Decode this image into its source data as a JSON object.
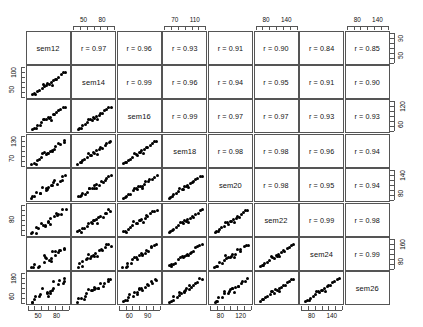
{
  "chart_data": {
    "type": "scatter",
    "subtype": "scatterplot-matrix",
    "title": "",
    "xlabel": "",
    "ylabel": "",
    "grid": false,
    "legend": false,
    "variables": [
      "sem12",
      "sem14",
      "sem16",
      "sem18",
      "sem20",
      "sem22",
      "sem24",
      "sem26"
    ],
    "upper_panel_content": "pearson-correlation",
    "lower_panel_content": "scatter-points",
    "diagonal_content": "variable-name",
    "correlation_prefix": "r = ",
    "correlation_matrix": [
      [
        null,
        "r = 0.97",
        "r = 0.96",
        "r = 0.93",
        "r = 0.91",
        "r = 0.90",
        "r = 0.84",
        "r = 0.85"
      ],
      [
        null,
        null,
        "r = 0.99",
        "r = 0.96",
        "r = 0.94",
        "r = 0.95",
        "r = 0.91",
        "r = 0.90"
      ],
      [
        null,
        null,
        null,
        "r = 0.99",
        "r = 0.97",
        "r = 0.97",
        "r = 0.93",
        "r = 0.93"
      ],
      [
        null,
        null,
        null,
        null,
        "r = 0.98",
        "r = 0.98",
        "r = 0.96",
        "r = 0.94"
      ],
      [
        null,
        null,
        null,
        null,
        null,
        "r = 0.98",
        "r = 0.95",
        "r = 0.94"
      ],
      [
        null,
        null,
        null,
        null,
        null,
        null,
        "r = 0.99",
        "r = 0.98"
      ],
      [
        null,
        null,
        null,
        null,
        null,
        null,
        null,
        "r = 0.99"
      ],
      [
        null,
        null,
        null,
        null,
        null,
        null,
        null,
        null
      ]
    ],
    "correlation_values": [
      [
        1.0,
        0.97,
        0.96,
        0.93,
        0.91,
        0.9,
        0.84,
        0.85
      ],
      [
        0.97,
        1.0,
        0.99,
        0.96,
        0.94,
        0.95,
        0.91,
        0.9
      ],
      [
        0.96,
        0.99,
        1.0,
        0.99,
        0.97,
        0.97,
        0.93,
        0.93
      ],
      [
        0.93,
        0.96,
        0.99,
        1.0,
        0.98,
        0.98,
        0.96,
        0.94
      ],
      [
        0.91,
        0.94,
        0.97,
        0.98,
        1.0,
        0.98,
        0.95,
        0.94
      ],
      [
        0.9,
        0.95,
        0.97,
        0.98,
        0.98,
        1.0,
        0.99,
        0.98
      ],
      [
        0.84,
        0.91,
        0.93,
        0.96,
        0.95,
        0.99,
        1.0,
        0.99
      ],
      [
        0.85,
        0.9,
        0.93,
        0.94,
        0.94,
        0.98,
        0.99,
        1.0
      ]
    ],
    "axes": {
      "top": [
        {
          "column": 2,
          "variable": "sem14",
          "ticks": [
            "50",
            "80"
          ],
          "tick_values": [
            50,
            80
          ]
        },
        {
          "column": 4,
          "variable": "sem18",
          "ticks": [
            "70",
            "110"
          ],
          "tick_values": [
            70,
            110
          ]
        },
        {
          "column": 6,
          "variable": "sem22",
          "ticks": [
            "80",
            "140"
          ],
          "tick_values": [
            80,
            140
          ]
        },
        {
          "column": 8,
          "variable": "sem26",
          "ticks": [
            "80",
            "140"
          ],
          "tick_values": [
            80,
            140
          ]
        }
      ],
      "bottom": [
        {
          "column": 1,
          "variable": "sem12",
          "ticks": [
            "50",
            "80"
          ],
          "tick_values": [
            50,
            80
          ]
        },
        {
          "column": 3,
          "variable": "sem16",
          "ticks": [
            "60",
            "90"
          ],
          "tick_values": [
            60,
            90
          ]
        },
        {
          "column": 5,
          "variable": "sem20",
          "ticks": [
            "80",
            "120"
          ],
          "tick_values": [
            80,
            120
          ]
        },
        {
          "column": 7,
          "variable": "sem24",
          "ticks": [
            "80",
            "140"
          ],
          "tick_values": [
            80,
            140
          ]
        }
      ],
      "left": [
        {
          "row": 2,
          "variable": "sem14",
          "ticks": [
            "50",
            "100"
          ],
          "tick_values": [
            50,
            100
          ]
        },
        {
          "row": 4,
          "variable": "sem18",
          "ticks": [
            "70",
            "130"
          ],
          "tick_values": [
            70,
            130
          ]
        },
        {
          "row": 6,
          "variable": "sem22",
          "ticks": [
            "80"
          ],
          "tick_values": [
            80
          ]
        },
        {
          "row": 8,
          "variable": "sem26",
          "ticks": [
            "60",
            "180"
          ],
          "tick_values": [
            60,
            180
          ]
        }
      ],
      "right": [
        {
          "row": 1,
          "variable": "sem12",
          "ticks": [
            "50",
            "90"
          ],
          "tick_values": [
            50,
            90
          ]
        },
        {
          "row": 3,
          "variable": "sem16",
          "ticks": [
            "60",
            "120"
          ],
          "tick_values": [
            60,
            120
          ]
        },
        {
          "row": 5,
          "variable": "sem20",
          "ticks": [
            "80",
            "140"
          ],
          "tick_values": [
            80,
            140
          ]
        },
        {
          "row": 7,
          "variable": "sem24",
          "ticks": [
            "80",
            "160"
          ],
          "tick_values": [
            80,
            160
          ]
        }
      ]
    },
    "n_points_per_panel": 20,
    "points_normalized": [
      [
        0.04,
        0.06
      ],
      [
        0.09,
        0.11
      ],
      [
        0.13,
        0.1
      ],
      [
        0.17,
        0.19
      ],
      [
        0.24,
        0.25
      ],
      [
        0.3,
        0.33
      ],
      [
        0.34,
        0.47
      ],
      [
        0.39,
        0.44
      ],
      [
        0.43,
        0.4
      ],
      [
        0.47,
        0.52
      ],
      [
        0.51,
        0.5
      ],
      [
        0.55,
        0.57
      ],
      [
        0.58,
        0.45
      ],
      [
        0.63,
        0.62
      ],
      [
        0.67,
        0.7
      ],
      [
        0.72,
        0.69
      ],
      [
        0.78,
        0.8
      ],
      [
        0.84,
        0.86
      ],
      [
        0.9,
        0.93
      ],
      [
        0.96,
        0.95
      ]
    ],
    "colors": {
      "point": "#000000",
      "panel_border": "#555555",
      "text": "#111111",
      "background": "#ffffff"
    }
  }
}
